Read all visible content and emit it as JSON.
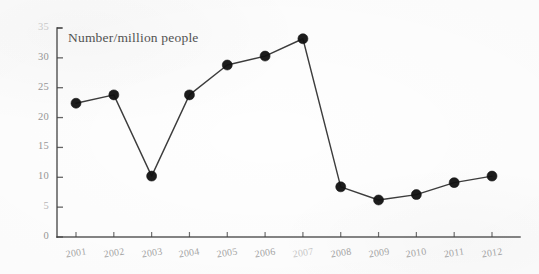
{
  "figure": {
    "background_color": "#fefefe",
    "axis_color": "#404040",
    "marker_color": "#111111",
    "line_color": "#2b2b2b",
    "tick_text_color": "#6e6e6e",
    "title_text_color": "#3a3a3a"
  },
  "chart_data": {
    "type": "line",
    "title": "Number/million people",
    "subtitle": "",
    "xlabel": "",
    "ylabel": "",
    "categories": [
      "2001",
      "2002",
      "2003",
      "2004",
      "2005",
      "2006",
      "2007",
      "2008",
      "2009",
      "2010",
      "2011",
      "2012"
    ],
    "values": [
      22.4,
      23.8,
      10.2,
      23.8,
      28.8,
      30.3,
      33.2,
      8.4,
      6.2,
      7.1,
      9.1,
      10.2
    ],
    "ylim": [
      0,
      35
    ],
    "yticks": [
      0,
      5,
      10,
      15,
      20,
      25,
      30,
      35
    ],
    "ytick_labels": [
      "0",
      "5",
      "10",
      "15",
      "20",
      "25",
      "30",
      "35"
    ],
    "xtick_labels": [
      "2001",
      "2002",
      "2003",
      "2004",
      "2005",
      "2006",
      "2007",
      "2008",
      "2009",
      "2010",
      "2011",
      "2012"
    ],
    "grid": false,
    "legend": false,
    "legend_position": "none",
    "marker": "filled-circle",
    "marker_size": 5,
    "line_width": 1.4,
    "annotations": []
  }
}
